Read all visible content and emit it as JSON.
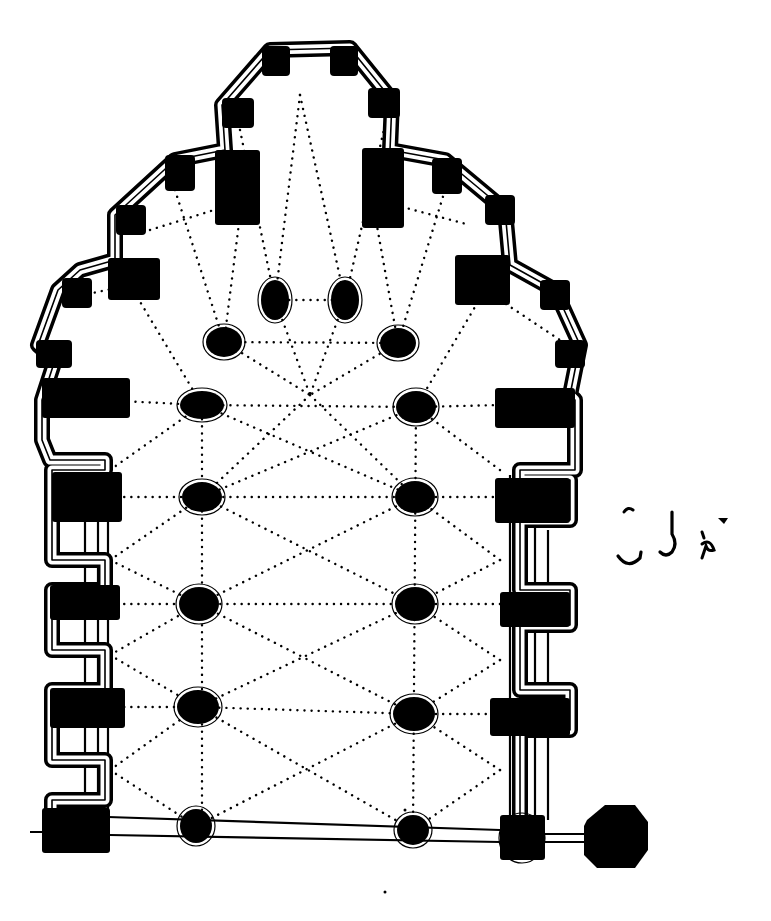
{
  "figure": {
    "type": "architectural-ground-plan",
    "subject": "Church plan with polygonal apse, radiating chapels, nave piers and vault ribs",
    "ink_color": "#000000",
    "paper_color": "#ffffff",
    "canvas": {
      "width": 771,
      "height": 921
    }
  },
  "annotation": {
    "kind": "handwritten",
    "text": "(illegible handwritten mark)",
    "position": {
      "x": 615,
      "y": 500,
      "width": 135,
      "height": 75
    }
  },
  "outer_wall": {
    "description": "Outer wall outline with stepped chapels around the apse",
    "points": [
      [
        52,
        830
      ],
      [
        52,
        800
      ],
      [
        105,
        800
      ],
      [
        105,
        760
      ],
      [
        52,
        760
      ],
      [
        52,
        690
      ],
      [
        105,
        690
      ],
      [
        105,
        650
      ],
      [
        52,
        650
      ],
      [
        52,
        590
      ],
      [
        105,
        590
      ],
      [
        105,
        560
      ],
      [
        52,
        560
      ],
      [
        52,
        470
      ],
      [
        105,
        470
      ],
      [
        105,
        460
      ],
      [
        50,
        460
      ],
      [
        42,
        440
      ],
      [
        42,
        400
      ],
      [
        55,
        360
      ],
      [
        38,
        345
      ],
      [
        58,
        290
      ],
      [
        80,
        270
      ],
      [
        115,
        260
      ],
      [
        115,
        215
      ],
      [
        175,
        160
      ],
      [
        225,
        150
      ],
      [
        222,
        105
      ],
      [
        270,
        50
      ],
      [
        350,
        48
      ],
      [
        392,
        100
      ],
      [
        390,
        150
      ],
      [
        445,
        160
      ],
      [
        505,
        210
      ],
      [
        510,
        265
      ],
      [
        555,
        290
      ],
      [
        580,
        345
      ],
      [
        570,
        395
      ],
      [
        575,
        400
      ],
      [
        575,
        470
      ],
      [
        520,
        470
      ],
      [
        520,
        480
      ],
      [
        570,
        480
      ],
      [
        570,
        520
      ],
      [
        520,
        520
      ],
      [
        520,
        590
      ],
      [
        570,
        590
      ],
      [
        570,
        625
      ],
      [
        520,
        625
      ],
      [
        520,
        690
      ],
      [
        570,
        690
      ],
      [
        570,
        730
      ],
      [
        520,
        730
      ],
      [
        520,
        830
      ]
    ]
  },
  "apse_buttress_blocks": [
    {
      "name": "apse-top-left",
      "x": 262,
      "y": 46,
      "w": 28,
      "h": 30
    },
    {
      "name": "apse-top-right",
      "x": 330,
      "y": 46,
      "w": 28,
      "h": 30
    },
    {
      "name": "apse-upper-left",
      "x": 222,
      "y": 98,
      "w": 32,
      "h": 30
    },
    {
      "name": "apse-upper-right",
      "x": 368,
      "y": 88,
      "w": 32,
      "h": 30
    },
    {
      "name": "chapel-left-top",
      "x": 165,
      "y": 155,
      "w": 30,
      "h": 36
    },
    {
      "name": "chapel-right-top",
      "x": 432,
      "y": 158,
      "w": 30,
      "h": 36
    },
    {
      "name": "chapel-left-mid",
      "x": 116,
      "y": 205,
      "w": 30,
      "h": 30
    },
    {
      "name": "chapel-right-mid",
      "x": 485,
      "y": 195,
      "w": 30,
      "h": 30
    },
    {
      "name": "chapel-left-low",
      "x": 62,
      "y": 278,
      "w": 30,
      "h": 30
    },
    {
      "name": "chapel-right-low",
      "x": 540,
      "y": 280,
      "w": 30,
      "h": 30
    },
    {
      "name": "chapel-left-base",
      "x": 36,
      "y": 340,
      "w": 36,
      "h": 28
    },
    {
      "name": "chapel-right-base",
      "x": 555,
      "y": 340,
      "w": 30,
      "h": 28
    }
  ],
  "wall_piers": [
    {
      "name": "left-pier-apse",
      "x": 215,
      "y": 150,
      "w": 45,
      "h": 75
    },
    {
      "name": "right-pier-apse",
      "x": 362,
      "y": 148,
      "w": 42,
      "h": 80
    },
    {
      "name": "left-pier-chapel",
      "x": 108,
      "y": 258,
      "w": 52,
      "h": 42
    },
    {
      "name": "right-pier-chapel",
      "x": 455,
      "y": 255,
      "w": 55,
      "h": 50
    },
    {
      "name": "left-pier-1",
      "x": 42,
      "y": 378,
      "w": 88,
      "h": 40
    },
    {
      "name": "right-pier-1",
      "x": 495,
      "y": 388,
      "w": 80,
      "h": 40
    },
    {
      "name": "left-pier-2",
      "x": 52,
      "y": 472,
      "w": 70,
      "h": 50
    },
    {
      "name": "right-pier-2",
      "x": 495,
      "y": 478,
      "w": 75,
      "h": 45
    },
    {
      "name": "left-pier-3",
      "x": 50,
      "y": 585,
      "w": 70,
      "h": 35
    },
    {
      "name": "right-pier-3",
      "x": 500,
      "y": 592,
      "w": 70,
      "h": 35
    },
    {
      "name": "left-pier-4",
      "x": 50,
      "y": 688,
      "w": 75,
      "h": 40
    },
    {
      "name": "right-pier-4",
      "x": 490,
      "y": 698,
      "w": 80,
      "h": 38
    },
    {
      "name": "left-pier-west",
      "x": 42,
      "y": 808,
      "w": 68,
      "h": 45
    },
    {
      "name": "right-pier-west",
      "x": 500,
      "y": 815,
      "w": 45,
      "h": 45
    }
  ],
  "nave_piers": [
    {
      "name": "pier-apse-left",
      "cx": 275,
      "cy": 300,
      "rx": 14,
      "ry": 20
    },
    {
      "name": "pier-apse-right",
      "cx": 345,
      "cy": 300,
      "rx": 14,
      "ry": 20
    },
    {
      "name": "pier-hemicycle-left",
      "cx": 224,
      "cy": 342,
      "rx": 18,
      "ry": 15
    },
    {
      "name": "pier-hemicycle-right",
      "cx": 398,
      "cy": 343,
      "rx": 18,
      "ry": 15
    },
    {
      "name": "pier-row1-left",
      "cx": 202,
      "cy": 405,
      "rx": 22,
      "ry": 14
    },
    {
      "name": "pier-row1-right",
      "cx": 416,
      "cy": 407,
      "rx": 20,
      "ry": 16
    },
    {
      "name": "pier-row2-left",
      "cx": 202,
      "cy": 497,
      "rx": 20,
      "ry": 15
    },
    {
      "name": "pier-row2-right",
      "cx": 415,
      "cy": 497,
      "rx": 20,
      "ry": 16
    },
    {
      "name": "pier-row3-left",
      "cx": 199,
      "cy": 604,
      "rx": 20,
      "ry": 17
    },
    {
      "name": "pier-row3-right",
      "cx": 415,
      "cy": 604,
      "rx": 20,
      "ry": 17
    },
    {
      "name": "pier-row4-left",
      "cx": 198,
      "cy": 707,
      "rx": 21,
      "ry": 17
    },
    {
      "name": "pier-row4-right",
      "cx": 414,
      "cy": 714,
      "rx": 21,
      "ry": 17
    },
    {
      "name": "pier-west-left",
      "cx": 196,
      "cy": 826,
      "rx": 16,
      "ry": 17
    },
    {
      "name": "pier-west-right",
      "cx": 413,
      "cy": 830,
      "rx": 16,
      "ry": 15
    },
    {
      "name": "pier-west-corner",
      "cx": 522,
      "cy": 838,
      "rx": 20,
      "ry": 22
    }
  ],
  "tower": {
    "name": "west-tower-base",
    "points": [
      [
        587,
        820
      ],
      [
        605,
        805
      ],
      [
        635,
        805
      ],
      [
        648,
        822
      ],
      [
        648,
        850
      ],
      [
        635,
        868
      ],
      [
        597,
        868
      ],
      [
        584,
        855
      ],
      [
        584,
        826
      ]
    ]
  },
  "west_facade_lines": [
    [
      [
        30,
        832
      ],
      [
        110,
        832
      ]
    ],
    [
      [
        108,
        817
      ],
      [
        500,
        830
      ]
    ],
    [
      [
        110,
        835
      ],
      [
        500,
        842
      ]
    ],
    [
      [
        545,
        834
      ],
      [
        585,
        834
      ]
    ],
    [
      [
        545,
        842
      ],
      [
        585,
        842
      ]
    ]
  ],
  "aisle_wall_lines": [
    [
      [
        85,
        470
      ],
      [
        85,
        810
      ]
    ],
    [
      [
        98,
        470
      ],
      [
        98,
        810
      ]
    ],
    [
      [
        108,
        470
      ],
      [
        108,
        810
      ]
    ],
    [
      [
        510,
        475
      ],
      [
        510,
        815
      ]
    ],
    [
      [
        520,
        475
      ],
      [
        520,
        815
      ]
    ],
    [
      [
        535,
        480
      ],
      [
        535,
        815
      ]
    ],
    [
      [
        548,
        530
      ],
      [
        548,
        820
      ]
    ]
  ],
  "vault_ribs": [
    [
      [
        275,
        300
      ],
      [
        345,
        300
      ]
    ],
    [
      [
        224,
        342
      ],
      [
        398,
        343
      ]
    ],
    [
      [
        202,
        405
      ],
      [
        416,
        407
      ]
    ],
    [
      [
        202,
        497
      ],
      [
        415,
        497
      ]
    ],
    [
      [
        199,
        604
      ],
      [
        415,
        604
      ]
    ],
    [
      [
        198,
        707
      ],
      [
        414,
        714
      ]
    ],
    [
      [
        202,
        405
      ],
      [
        415,
        497
      ]
    ],
    [
      [
        416,
        407
      ],
      [
        202,
        497
      ]
    ],
    [
      [
        202,
        497
      ],
      [
        415,
        604
      ]
    ],
    [
      [
        415,
        497
      ],
      [
        199,
        604
      ]
    ],
    [
      [
        199,
        604
      ],
      [
        414,
        714
      ]
    ],
    [
      [
        415,
        604
      ],
      [
        198,
        707
      ]
    ],
    [
      [
        198,
        707
      ],
      [
        413,
        830
      ]
    ],
    [
      [
        414,
        714
      ],
      [
        196,
        826
      ]
    ],
    [
      [
        202,
        405
      ],
      [
        202,
        826
      ]
    ],
    [
      [
        416,
        407
      ],
      [
        413,
        830
      ]
    ],
    [
      [
        275,
        300
      ],
      [
        310,
        395
      ]
    ],
    [
      [
        345,
        300
      ],
      [
        310,
        395
      ]
    ],
    [
      [
        310,
        395
      ],
      [
        202,
        497
      ]
    ],
    [
      [
        310,
        395
      ],
      [
        415,
        497
      ]
    ],
    [
      [
        224,
        342
      ],
      [
        310,
        395
      ]
    ],
    [
      [
        398,
        343
      ],
      [
        310,
        395
      ]
    ],
    [
      [
        300,
        95
      ],
      [
        275,
        300
      ]
    ],
    [
      [
        300,
        95
      ],
      [
        345,
        300
      ]
    ],
    [
      [
        240,
        130
      ],
      [
        275,
        300
      ]
    ],
    [
      [
        385,
        125
      ],
      [
        345,
        300
      ]
    ],
    [
      [
        240,
        215
      ],
      [
        224,
        342
      ]
    ],
    [
      [
        375,
        215
      ],
      [
        398,
        343
      ]
    ],
    [
      [
        175,
        190
      ],
      [
        224,
        342
      ]
    ],
    [
      [
        445,
        190
      ],
      [
        398,
        343
      ]
    ],
    [
      [
        130,
        285
      ],
      [
        202,
        405
      ]
    ],
    [
      [
        485,
        290
      ],
      [
        416,
        407
      ]
    ],
    [
      [
        100,
        400
      ],
      [
        202,
        405
      ]
    ],
    [
      [
        500,
        405
      ],
      [
        416,
        407
      ]
    ],
    [
      [
        110,
        497
      ],
      [
        202,
        497
      ]
    ],
    [
      [
        500,
        497
      ],
      [
        415,
        497
      ]
    ],
    [
      [
        110,
        604
      ],
      [
        199,
        604
      ]
    ],
    [
      [
        500,
        604
      ],
      [
        415,
        604
      ]
    ],
    [
      [
        110,
        707
      ],
      [
        198,
        707
      ]
    ],
    [
      [
        500,
        714
      ],
      [
        414,
        714
      ]
    ],
    [
      [
        110,
        470
      ],
      [
        202,
        405
      ]
    ],
    [
      [
        500,
        470
      ],
      [
        416,
        407
      ]
    ],
    [
      [
        110,
        560
      ],
      [
        202,
        497
      ]
    ],
    [
      [
        110,
        560
      ],
      [
        199,
        604
      ]
    ],
    [
      [
        500,
        560
      ],
      [
        415,
        497
      ]
    ],
    [
      [
        500,
        560
      ],
      [
        415,
        604
      ]
    ],
    [
      [
        110,
        655
      ],
      [
        199,
        604
      ]
    ],
    [
      [
        110,
        655
      ],
      [
        198,
        707
      ]
    ],
    [
      [
        500,
        660
      ],
      [
        415,
        604
      ]
    ],
    [
      [
        500,
        660
      ],
      [
        414,
        714
      ]
    ],
    [
      [
        110,
        770
      ],
      [
        198,
        707
      ]
    ],
    [
      [
        110,
        770
      ],
      [
        196,
        826
      ]
    ],
    [
      [
        500,
        770
      ],
      [
        414,
        714
      ]
    ],
    [
      [
        500,
        770
      ],
      [
        413,
        830
      ]
    ],
    [
      [
        60,
        300
      ],
      [
        130,
        285
      ]
    ],
    [
      [
        150,
        230
      ],
      [
        230,
        205
      ]
    ],
    [
      [
        395,
        205
      ],
      [
        470,
        225
      ]
    ],
    [
      [
        500,
        300
      ],
      [
        560,
        340
      ]
    ]
  ],
  "stray_marks": [
    [
      385,
      892
    ],
    [
      596,
      858
    ],
    [
      405,
      810
    ]
  ]
}
